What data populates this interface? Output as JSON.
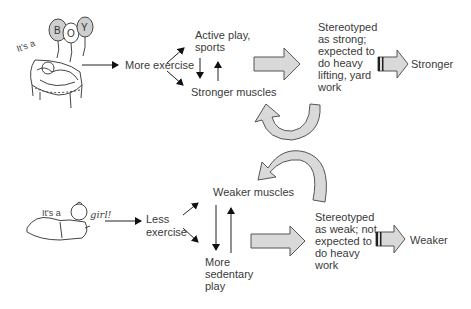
{
  "boy": {
    "caption": "It's a",
    "balloons": [
      "B",
      "O",
      "Y"
    ],
    "path": {
      "start": "More exercise",
      "branch_top": "Active play, sports",
      "branch_top_lines": [
        "Active play,",
        "sports"
      ],
      "branch_bottom": "Stronger muscles",
      "stereotype_lines": [
        "Stereotyped",
        "as strong;",
        "expected to",
        "do heavy",
        "lifting, yard",
        "work"
      ],
      "outcome": "Stronger"
    }
  },
  "girl": {
    "caption": "It's a",
    "word": "girl!",
    "path": {
      "start_lines": [
        "Less",
        "exercise"
      ],
      "branch_top": "Weaker muscles",
      "branch_bottom_lines": [
        "More",
        "sedentary",
        "play"
      ],
      "stereotype_lines": [
        "Stereotyped",
        "as weak; not",
        "expected to",
        "do heavy",
        "work"
      ],
      "outcome": "Weaker"
    }
  },
  "colors": {
    "arrow_fill": "#d9d9d9",
    "arrow_stroke": "#555555",
    "line": "#222222"
  }
}
